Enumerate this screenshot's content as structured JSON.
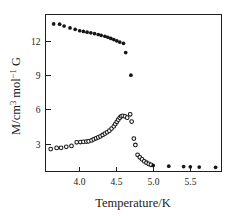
{
  "chart_data": {
    "type": "scatter",
    "title": "",
    "xlabel": "Temperature/K",
    "ylabel": "M/cm3 mol-1 G",
    "ylabel_display": "M/cm³ mol⁻¹ G",
    "xlim": [
      3.55,
      5.92
    ],
    "ylim": [
      0.55,
      14.35
    ],
    "xticks": [
      4.0,
      4.5,
      5.0,
      5.5
    ],
    "xtick_labels": [
      "4.0",
      "4.5",
      "5.0",
      "5.5"
    ],
    "yticks": [
      3,
      6,
      9,
      12
    ],
    "ytick_labels": [
      "3",
      "6",
      "9",
      "12"
    ],
    "grid": false,
    "legend": "none",
    "frame": "box",
    "series": [
      {
        "name": "upper-branch",
        "marker": "filled-circle",
        "color": "#151515",
        "points": [
          [
            3.66,
            13.52
          ],
          [
            3.74,
            13.5
          ],
          [
            3.8,
            13.34
          ],
          [
            3.88,
            13.17
          ],
          [
            3.95,
            13.05
          ],
          [
            4.01,
            12.92
          ],
          [
            4.06,
            12.86
          ],
          [
            4.11,
            12.8
          ],
          [
            4.16,
            12.74
          ],
          [
            4.21,
            12.67
          ],
          [
            4.26,
            12.59
          ],
          [
            4.3,
            12.52
          ],
          [
            4.35,
            12.44
          ],
          [
            4.39,
            12.35
          ],
          [
            4.43,
            12.25
          ],
          [
            4.47,
            12.15
          ],
          [
            4.51,
            12.04
          ],
          [
            4.55,
            11.93
          ],
          [
            4.6,
            11.82
          ],
          [
            4.63,
            11.0
          ],
          [
            4.7,
            9.02
          ]
        ]
      },
      {
        "name": "lower-branch",
        "marker": "open-circle",
        "color": "#151515",
        "points": [
          [
            3.62,
            2.52
          ],
          [
            3.7,
            2.62
          ],
          [
            3.76,
            2.63
          ],
          [
            3.83,
            2.72
          ],
          [
            3.9,
            2.8
          ],
          [
            3.97,
            3.12
          ],
          [
            4.02,
            3.14
          ],
          [
            4.06,
            3.16
          ],
          [
            4.1,
            3.18
          ],
          [
            4.13,
            3.2
          ],
          [
            4.17,
            3.28
          ],
          [
            4.2,
            3.38
          ],
          [
            4.23,
            3.47
          ],
          [
            4.26,
            3.55
          ],
          [
            4.29,
            3.64
          ],
          [
            4.32,
            3.76
          ],
          [
            4.35,
            3.88
          ],
          [
            4.38,
            4.0
          ],
          [
            4.41,
            4.14
          ],
          [
            4.44,
            4.32
          ],
          [
            4.47,
            4.52
          ],
          [
            4.49,
            4.72
          ],
          [
            4.51,
            4.92
          ],
          [
            4.53,
            5.1
          ],
          [
            4.55,
            5.28
          ],
          [
            4.57,
            5.4
          ],
          [
            4.59,
            5.44
          ],
          [
            4.62,
            5.4
          ],
          [
            4.65,
            5.28
          ],
          [
            4.69,
            5.58
          ],
          [
            4.71,
            4.94
          ],
          [
            4.74,
            3.44
          ],
          [
            4.76,
            2.88
          ],
          [
            4.79,
            2.02
          ],
          [
            4.82,
            1.8
          ],
          [
            4.85,
            1.62
          ],
          [
            4.88,
            1.44
          ],
          [
            4.91,
            1.32
          ],
          [
            4.94,
            1.22
          ],
          [
            4.97,
            1.14
          ]
        ]
      },
      {
        "name": "high-temperature-tail",
        "marker": "filled-circle",
        "color": "#151515",
        "points": [
          [
            5.0,
            1.08
          ],
          [
            5.21,
            1.02
          ],
          [
            5.41,
            0.98
          ],
          [
            5.5,
            0.96
          ],
          [
            5.62,
            0.94
          ],
          [
            5.84,
            0.92
          ]
        ]
      }
    ]
  },
  "style": {
    "background": "#ffffff",
    "axis_color": "#1f1f1f",
    "marker_color": "#151515"
  }
}
